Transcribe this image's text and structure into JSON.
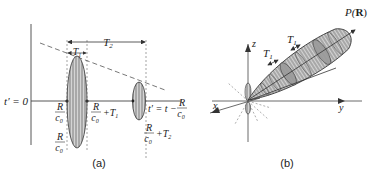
{
  "figure": {
    "panel_a": {
      "caption": "(a)",
      "labels": {
        "t_prime_zero": "t′ = 0",
        "T1": "T",
        "T1_sub": "1",
        "T2": "T",
        "T2_sub": "2",
        "R": "R",
        "c0": "c",
        "c0_sub": "0",
        "plus_T1": "+T",
        "plus_T1_sub": "1",
        "plus_T2": "+T",
        "plus_T2_sub": "2",
        "t_prime_eq": "t′ = t −"
      },
      "colors": {
        "ink": "#333333",
        "fill": "#b8b8b8",
        "dashed": "#555555"
      }
    },
    "panel_b": {
      "caption": "(b)",
      "labels": {
        "P": "P(",
        "R_bold": "R",
        "P_close": ")",
        "T1a": "T",
        "T1a_sub": "1",
        "T1b": "T",
        "T1b_sub": "1",
        "x": "x",
        "y": "y",
        "z": "z"
      },
      "colors": {
        "ink": "#333333",
        "fill": "#9a9a9a"
      }
    }
  }
}
